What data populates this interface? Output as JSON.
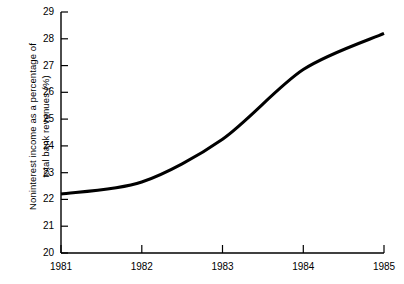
{
  "chart_data": {
    "type": "line",
    "title": "",
    "xlabel": "",
    "ylabel": "Noninterest income as a percentage of\ntotal bank revenues (%)",
    "ylabel_line1": "Noninterest income as a percentage of",
    "ylabel_line2": "total bank revenues (%)",
    "categories": [
      "1981",
      "1982",
      "1983",
      "1984",
      "1985"
    ],
    "x": [
      1981,
      1982,
      1983,
      1984,
      1985
    ],
    "values": [
      22.2,
      22.65,
      24.25,
      26.85,
      28.2
    ],
    "series": [
      {
        "name": "Noninterest income share of total bank revenues",
        "values": [
          22.2,
          22.65,
          24.25,
          26.85,
          28.2
        ]
      }
    ],
    "ylim": [
      20,
      29
    ],
    "xlim": [
      1981,
      1985
    ],
    "y_ticks": [
      20,
      21,
      22,
      23,
      24,
      25,
      26,
      27,
      28,
      29
    ],
    "y_tick_labels": [
      "20",
      "21",
      "22",
      "23",
      "24",
      "25",
      "26",
      "27",
      "28",
      "29"
    ],
    "x_ticks": [
      1981,
      1982,
      1983,
      1984,
      1985
    ],
    "x_tick_labels": [
      "1981",
      "1982",
      "1983",
      "1984",
      "1985"
    ],
    "grid": false,
    "legend": false,
    "legend_position": "none",
    "line_color": "#000000",
    "line_width": 3,
    "background_color": "#ffffff",
    "axis_color": "#000000"
  },
  "axes": {
    "y_tick_0": "20",
    "y_tick_1": "21",
    "y_tick_2": "22",
    "y_tick_3": "23",
    "y_tick_4": "24",
    "y_tick_5": "25",
    "y_tick_6": "26",
    "y_tick_7": "27",
    "y_tick_8": "28",
    "y_tick_9": "29",
    "x_tick_0": "1981",
    "x_tick_1": "1982",
    "x_tick_2": "1983",
    "x_tick_3": "1984",
    "x_tick_4": "1985"
  }
}
